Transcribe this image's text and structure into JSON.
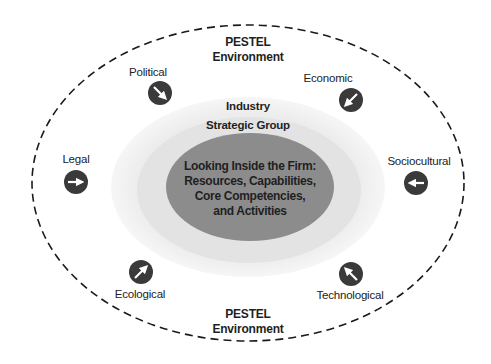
{
  "diagram": {
    "type": "nested-ellipses",
    "colors": {
      "outer_dash": "#1a1a1a",
      "industry_fill": "#f0f0f0",
      "strategic_group_fill": "#e2e2e2",
      "core_fill": "#8c8c8c",
      "icon_fill": "#3a3a3a",
      "icon_arrow": "#ffffff",
      "text": "#1f1f1f"
    },
    "outer": {
      "top_label": [
        "PESTEL",
        "Environment"
      ],
      "bottom_label": [
        "PESTEL",
        "Environment"
      ]
    },
    "industry_label": "Industry",
    "strategic_group_label": "Strategic Group",
    "core_label": [
      "Looking Inside the Firm:",
      "Resources, Capabilities,",
      "Core Competencies,",
      "and Activities"
    ],
    "factors": [
      {
        "label": "Political",
        "icon": "arrow-down-right-icon"
      },
      {
        "label": "Economic",
        "icon": "arrow-down-left-icon"
      },
      {
        "label": "Legal",
        "icon": "arrow-right-icon"
      },
      {
        "label": "Sociocultural",
        "icon": "arrow-left-icon"
      },
      {
        "label": "Ecological",
        "icon": "arrow-up-right-icon"
      },
      {
        "label": "Technological",
        "icon": "arrow-up-left-icon"
      }
    ]
  }
}
